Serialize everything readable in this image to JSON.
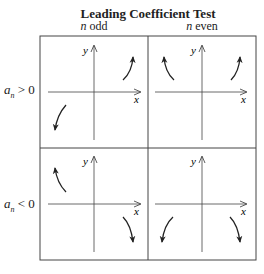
{
  "title": "Leading Coefficient Test",
  "columns": [
    {
      "var": "n",
      "label": "odd"
    },
    {
      "var": "n",
      "label": "even"
    }
  ],
  "rows": [
    {
      "var": "a",
      "sub": "n",
      "relation": "> 0"
    },
    {
      "var": "a",
      "sub": "n",
      "relation": "< 0"
    }
  ],
  "axes": {
    "x": "x",
    "y": "y"
  },
  "cells": [
    {
      "row": "a_n > 0",
      "col": "n odd",
      "left_end": "down",
      "right_end": "up"
    },
    {
      "row": "a_n > 0",
      "col": "n even",
      "left_end": "up",
      "right_end": "up"
    },
    {
      "row": "a_n < 0",
      "col": "n odd",
      "left_end": "up",
      "right_end": "down"
    },
    {
      "row": "a_n < 0",
      "col": "n even",
      "left_end": "down",
      "right_end": "down"
    }
  ],
  "colors": {
    "line": "#222222",
    "grid": "#444444"
  }
}
